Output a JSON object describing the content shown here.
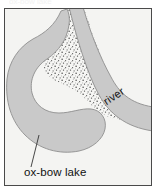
{
  "figure": {
    "kind": "geography-diagram",
    "top_caption": "ox-bow lake",
    "frame": {
      "border_color": "#4a4a4a",
      "background_color": "#f4f4f2"
    }
  },
  "labels": {
    "river": "river",
    "ox_bow_lake": "ox-bow lake"
  },
  "colors": {
    "water_gray": "#c9c9c9",
    "water_outline": "#8e8e8e",
    "land_background": "#f4f4f2",
    "stipple_dot": "#4c4c4c",
    "text": "#111111",
    "pointer_line": "#333333"
  },
  "features": [
    {
      "name": "river-channel",
      "label": "river",
      "fill": "#c9c9c9",
      "description": "gray water band entering top, curving right and exiting the right edge"
    },
    {
      "name": "ox-bow-lake",
      "label": "ox-bow lake",
      "fill": "#c9c9c9",
      "description": "isolated crescent-shaped cut-off meander at lower left"
    },
    {
      "name": "sediment-land-area",
      "label": "",
      "fill": "stipple",
      "description": "stippled dotted land / point-bar deposit between lake and river"
    }
  ],
  "annotations": [
    {
      "name": "lake-pointer-line",
      "from": "ox-bow lake label",
      "to": "lake body"
    }
  ]
}
